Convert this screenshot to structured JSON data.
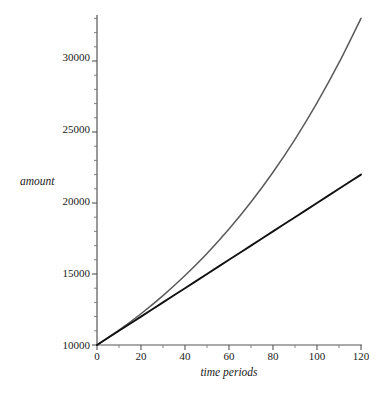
{
  "chart_data": {
    "type": "line",
    "title": "",
    "subtitle": "",
    "xlabel": "time periods",
    "ylabel": "amount",
    "xlim": [
      0,
      120
    ],
    "ylim": [
      10000,
      33250
    ],
    "grid": false,
    "legend": "none",
    "x_ticks": [
      0,
      20,
      40,
      60,
      80,
      100,
      120
    ],
    "x_tick_labels": [
      "0",
      "20",
      "40",
      "60",
      "80",
      "100",
      "120"
    ],
    "x_minor_step": 10,
    "y_ticks": [
      10000,
      15000,
      20000,
      25000,
      30000
    ],
    "y_tick_labels": [
      "10000",
      "15000",
      "20000",
      "25000",
      "30000"
    ],
    "y_minor_step": 1000,
    "x": [
      0,
      10,
      20,
      30,
      40,
      50,
      60,
      70,
      80,
      90,
      100,
      110,
      120
    ],
    "series": [
      {
        "name": "simple interest",
        "color": "#111111",
        "width": 1.9,
        "values": [
          10000,
          11000,
          12000,
          13000,
          14000,
          15000,
          16000,
          17000,
          18000,
          19000,
          20000,
          21000,
          22000
        ]
      },
      {
        "name": "compound interest",
        "color": "#5a5a5a",
        "width": 1.5,
        "values": [
          10000,
          11046,
          12202,
          13478,
          14889,
          16446,
          18167,
          20068,
          22167,
          24486,
          27048,
          29879,
          33004
        ]
      }
    ],
    "annotations": []
  },
  "labels": {
    "y_axis_title": "amount",
    "x_axis_title": "time periods",
    "y0": "10000",
    "y1": "15000",
    "y2": "20000",
    "y3": "25000",
    "y4": "30000",
    "x0": "0",
    "x1": "20",
    "x2": "40",
    "x3": "60",
    "x4": "80",
    "x5": "100",
    "x6": "120"
  }
}
